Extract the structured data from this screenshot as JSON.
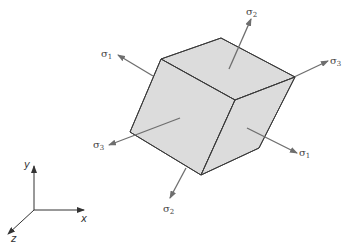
{
  "diagram": {
    "colors": {
      "face": "#dcdcdc",
      "edge": "#3a3a3a",
      "arrow": "#6e6e6e",
      "axis": "#333333"
    },
    "stress_labels": {
      "sigma1_upper_left": {
        "symbol": "σ",
        "sub": "1"
      },
      "sigma2_top": {
        "symbol": "σ",
        "sub": "2"
      },
      "sigma3_right": {
        "symbol": "σ",
        "sub": "3"
      },
      "sigma3_left": {
        "symbol": "σ",
        "sub": "3"
      },
      "sigma1_lower_right": {
        "symbol": "σ",
        "sub": "1"
      },
      "sigma2_bottom": {
        "symbol": "σ",
        "sub": "2"
      }
    },
    "axes": {
      "y": "y",
      "x": "x",
      "z": "z"
    }
  }
}
